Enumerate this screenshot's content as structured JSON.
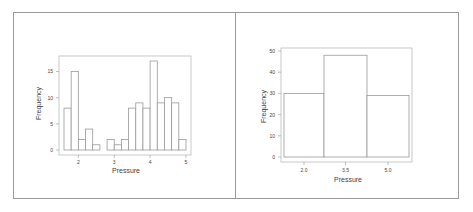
{
  "chart_data": [
    {
      "type": "bar",
      "subtype": "histogram",
      "title": "",
      "xlabel": "Pressure",
      "ylabel": "Frequency",
      "xlim": [
        1.6,
        5.0
      ],
      "ylim": [
        0,
        17
      ],
      "xticks": [
        2,
        3,
        4,
        5
      ],
      "yticks": [
        0,
        5,
        10,
        15
      ],
      "bin_edges": [
        1.6,
        1.8,
        2.0,
        2.2,
        2.4,
        2.6,
        2.8,
        3.0,
        3.2,
        3.4,
        3.6,
        3.8,
        4.0,
        4.2,
        4.4,
        4.6,
        4.8,
        5.0
      ],
      "values": [
        8,
        15,
        2,
        4,
        1,
        0,
        2,
        1,
        2,
        8,
        9,
        8,
        17,
        9,
        10,
        9,
        2
      ],
      "grid": false,
      "legend": null
    },
    {
      "type": "bar",
      "subtype": "histogram",
      "title": "",
      "xlabel": "Pressure",
      "ylabel": "Frequency",
      "ylim": [
        0,
        50
      ],
      "xticks": [
        "2.0",
        "3.5",
        "5.0"
      ],
      "yticks": [
        0,
        10,
        20,
        30,
        40,
        50
      ],
      "categories": [
        "2.0",
        "3.5",
        "5.0"
      ],
      "values": [
        30,
        48,
        29
      ],
      "grid": false,
      "legend": null
    }
  ],
  "labels": {
    "left_xlabel": "Pressure",
    "left_ylabel": "Frequency",
    "right_xlabel": "Pressure",
    "right_ylabel": "Frequency"
  }
}
